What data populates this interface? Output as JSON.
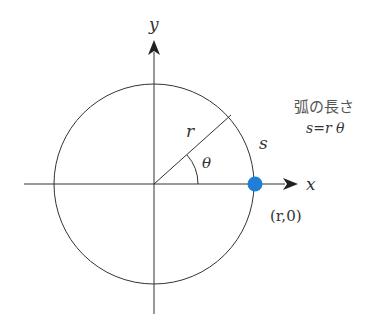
{
  "diagram": {
    "axes": {
      "x_label": "x",
      "y_label": "y"
    },
    "circle": {
      "radius_label": "r",
      "angle_label": "θ",
      "arc_label": "s"
    },
    "point": {
      "label": "(r,0)",
      "color": "#1f7fd6"
    },
    "caption": {
      "title": "弧の長さ",
      "formula": "s=r θ"
    }
  }
}
